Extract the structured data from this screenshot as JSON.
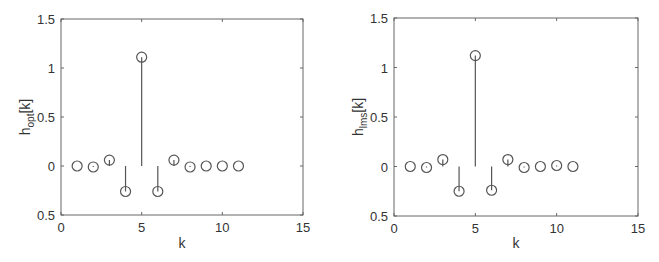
{
  "chart_data": [
    {
      "type": "stem",
      "title": "",
      "xlabel": "k",
      "ylabel": "h_opt[k]",
      "ylabel_main": "h",
      "ylabel_sub": "opt",
      "ylabel_suffix": "[k]",
      "xlim": [
        0,
        15
      ],
      "ylim": [
        -0.5,
        1.5
      ],
      "xticks": [
        "0",
        "5",
        "10",
        "15"
      ],
      "yticks": [
        "0.5",
        "0",
        "0.5",
        "1",
        "1.5"
      ],
      "grid": false,
      "x": [
        1,
        2,
        3,
        4,
        5,
        6,
        7,
        8,
        9,
        10,
        11
      ],
      "values": [
        0.0,
        -0.01,
        0.06,
        -0.26,
        1.11,
        -0.26,
        0.06,
        -0.01,
        0.0,
        0.0,
        0.0
      ],
      "marker": "open-circle",
      "color": "#555555"
    },
    {
      "type": "stem",
      "title": "",
      "xlabel": "k",
      "ylabel": "h_lms[k]",
      "ylabel_main": "h",
      "ylabel_sub": "lms",
      "ylabel_suffix": "[k]",
      "xlim": [
        0,
        15
      ],
      "ylim": [
        -0.5,
        1.5
      ],
      "xticks": [
        "0",
        "5",
        "10",
        "15"
      ],
      "yticks": [
        "0.5",
        "0",
        "0.5",
        "1",
        "1.5"
      ],
      "grid": false,
      "x": [
        1,
        2,
        3,
        4,
        5,
        6,
        7,
        8,
        9,
        10,
        11
      ],
      "values": [
        0.0,
        -0.01,
        0.07,
        -0.25,
        1.12,
        -0.24,
        0.07,
        -0.01,
        0.0,
        0.01,
        0.0
      ],
      "marker": "open-circle",
      "color": "#555555"
    }
  ]
}
